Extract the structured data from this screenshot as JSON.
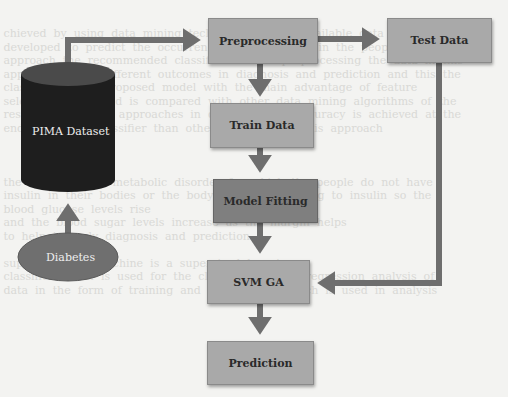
{
  "diagram": {
    "nodes": {
      "pima": {
        "label": "PIMA Dataset",
        "shape": "cylinder"
      },
      "diabetes": {
        "label": "Diabetes",
        "shape": "ellipse"
      },
      "preprocessing": {
        "label": "Preprocessing",
        "shape": "rectangle"
      },
      "test_data": {
        "label": "Test Data",
        "shape": "rectangle"
      },
      "train_data": {
        "label": "Train Data",
        "shape": "rectangle"
      },
      "model_fitting": {
        "label": "Model Fitting",
        "shape": "rectangle"
      },
      "svm_ga": {
        "label": "SVM GA",
        "shape": "rectangle"
      },
      "prediction": {
        "label": "Prediction",
        "shape": "rectangle"
      }
    },
    "edges": [
      {
        "from": "Diabetes",
        "to": "PIMA Dataset"
      },
      {
        "from": "PIMA Dataset",
        "to": "Preprocessing"
      },
      {
        "from": "Preprocessing",
        "to": "Test Data"
      },
      {
        "from": "Preprocessing",
        "to": "Train Data"
      },
      {
        "from": "Train Data",
        "to": "Model Fitting"
      },
      {
        "from": "Model Fitting",
        "to": "SVM GA"
      },
      {
        "from": "Test Data",
        "to": "SVM GA"
      },
      {
        "from": "SVM GA",
        "to": "Prediction"
      }
    ],
    "colors": {
      "cylinder": "#1e1e1e",
      "ellipse": "#6f6f6f",
      "box_light": "#a9a9a9",
      "box_dark": "#7f7f7f",
      "arrow": "#6e6e6e"
    }
  }
}
